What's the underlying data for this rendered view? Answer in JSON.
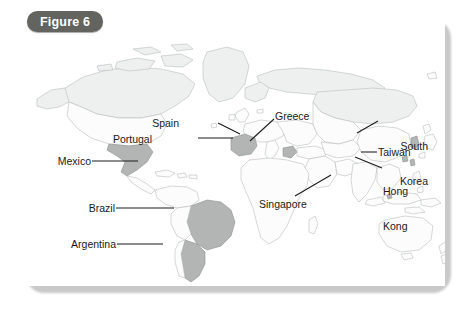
{
  "figure": {
    "badge_label": "Figure 6",
    "frame_color": "#131313",
    "badge_bg": "#63635f",
    "badge_text_color": "#ffffff"
  },
  "map": {
    "type": "world-map",
    "projection": "equirectangular-like",
    "ocean_color": "#ffffff",
    "land_outline_color": "#b9bcbe",
    "land_default_fill": "#fcfcfc",
    "land_tinted_fill": "#f0f1f1",
    "highlight_fill": "#b3b5b4",
    "highlight_outline": "#8e9190"
  },
  "labels": [
    {
      "id": "spain",
      "text": "Spain",
      "align": "right",
      "x": 179,
      "y": 118,
      "lines": [
        "Spain"
      ]
    },
    {
      "id": "portugal",
      "text": "Portugal",
      "align": "right",
      "x": 152,
      "y": 134,
      "lines": [
        "Portugal"
      ]
    },
    {
      "id": "greece",
      "text": "Greece",
      "align": "left",
      "x": 275,
      "y": 111,
      "lines": [
        "Greece"
      ]
    },
    {
      "id": "south-korea",
      "text": "South Korea",
      "align": "right",
      "x": 389,
      "y": 118,
      "lines": [
        "South",
        "Korea"
      ]
    },
    {
      "id": "taiwan",
      "text": "Taiwan",
      "align": "left",
      "x": 378,
      "y": 148,
      "lines": [
        "Taiwan"
      ]
    },
    {
      "id": "hong-kong",
      "text": "Hong Kong",
      "align": "left",
      "x": 383,
      "y": 164,
      "lines": [
        "Hong",
        "Kong"
      ]
    },
    {
      "id": "mexico",
      "text": "Mexico",
      "align": "right",
      "x": 53,
      "y": 157,
      "lines": [
        "Mexico"
      ]
    },
    {
      "id": "singapore",
      "text": "Singapore",
      "align": "left",
      "x": 259,
      "y": 199,
      "lines": [
        "Singapore"
      ]
    },
    {
      "id": "brazil",
      "text": "Brazil",
      "align": "right",
      "x": 80,
      "y": 204,
      "lines": [
        "Brazil"
      ]
    },
    {
      "id": "argentina",
      "text": "Argentina",
      "align": "right",
      "x": 55,
      "y": 240,
      "lines": [
        "Argentina"
      ]
    }
  ],
  "leader_lines": [
    {
      "id": "spain-leader",
      "from": [
        218,
        123
      ],
      "to": [
        240,
        134
      ]
    },
    {
      "id": "portugal-leader",
      "from": [
        198,
        138
      ],
      "to": [
        233,
        138
      ]
    },
    {
      "id": "greece-leader",
      "from": [
        274,
        119
      ],
      "to": [
        250,
        141
      ]
    },
    {
      "id": "south-korea-leader",
      "from": [
        357,
        133
      ],
      "to": [
        378,
        121
      ]
    },
    {
      "id": "taiwan-leader",
      "from": [
        361,
        152
      ],
      "to": [
        377,
        152
      ]
    },
    {
      "id": "hong-kong-leader",
      "from": [
        355,
        157
      ],
      "to": [
        382,
        168
      ]
    },
    {
      "id": "mexico-leader",
      "from": [
        92,
        161
      ],
      "to": [
        138,
        161
      ]
    },
    {
      "id": "singapore-leader",
      "from": [
        331,
        175
      ],
      "to": [
        295,
        196
      ]
    },
    {
      "id": "brazil-leader",
      "from": [
        116,
        208
      ],
      "to": [
        174,
        208
      ]
    },
    {
      "id": "argentina-leader",
      "from": [
        117,
        244
      ],
      "to": [
        163,
        244
      ]
    }
  ],
  "highlighted_countries": [
    "Mexico",
    "Brazil",
    "Argentina",
    "Spain",
    "Portugal",
    "Greece",
    "South Korea",
    "Taiwan",
    "Hong Kong",
    "Singapore"
  ]
}
